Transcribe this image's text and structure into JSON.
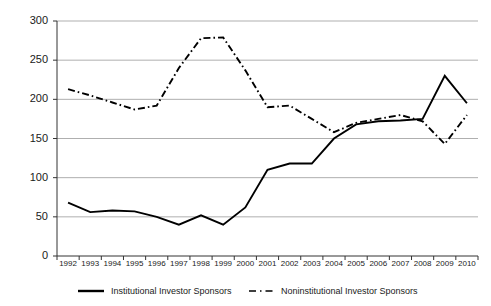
{
  "chart_data": {
    "type": "line",
    "title": "",
    "xlabel": "",
    "ylabel": "",
    "grid": true,
    "legend_position": "bottom",
    "ylim": [
      0,
      300
    ],
    "yticks": [
      0,
      50,
      100,
      150,
      200,
      250,
      300
    ],
    "categories": [
      "1992",
      "1993",
      "1994",
      "1995",
      "1996",
      "1997",
      "1998",
      "1999",
      "2000",
      "2001",
      "2002",
      "2003",
      "2004",
      "2005",
      "2006",
      "2007",
      "2008",
      "2009",
      "2010"
    ],
    "series": [
      {
        "name": "Institutional Investor Sponsors",
        "style": "solid",
        "color": "#000000",
        "values": [
          68,
          56,
          58,
          57,
          50,
          40,
          52,
          40,
          62,
          110,
          118,
          118,
          150,
          168,
          172,
          173,
          175,
          230,
          195
        ]
      },
      {
        "name": "Noninstitutional Investor Sponsors",
        "style": "dash-dot",
        "color": "#000000",
        "values": [
          213,
          205,
          196,
          187,
          192,
          240,
          278,
          279,
          237,
          190,
          192,
          175,
          158,
          170,
          175,
          180,
          172,
          143,
          180
        ]
      }
    ]
  },
  "legend": {
    "entries": [
      {
        "label": "Institutional Investor Sponsors",
        "style": "solid"
      },
      {
        "label": "Noninstitutional Investor Sponsors",
        "style": "dash-dot"
      }
    ]
  },
  "axis": {
    "y_tick_labels": [
      "300",
      "250",
      "200",
      "150",
      "100",
      "50",
      "0"
    ],
    "x_tick_labels": [
      "1992",
      "1993",
      "1994",
      "1995",
      "1996",
      "1997",
      "1998",
      "1999",
      "2000",
      "2001",
      "2002",
      "2003",
      "2004",
      "2005",
      "2006",
      "2007",
      "2008",
      "2009",
      "2010"
    ]
  },
  "colors": {
    "axis": "#333333",
    "grid": "#a6a6a6",
    "series": "#000000",
    "text": "#1a1a1a",
    "background": "#ffffff"
  }
}
